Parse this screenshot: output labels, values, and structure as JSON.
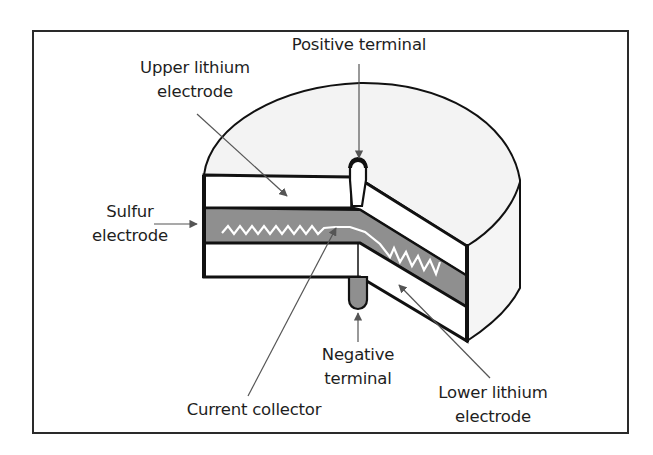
{
  "diagram": {
    "colors": {
      "frame": "#2a2a2a",
      "outline": "#111111",
      "casing_fill": "#f3f3f3",
      "electrode_fill": "#ffffff",
      "sulfur_fill": "#8f8f8f",
      "collector": "#ffffff",
      "leader": "#555555"
    },
    "labels": {
      "positive_terminal": {
        "line1": "Positive terminal"
      },
      "upper_lithium": {
        "line1": "Upper lithium",
        "line2": "electrode"
      },
      "sulfur": {
        "line1": "Sulfur",
        "line2": "electrode"
      },
      "negative_terminal": {
        "line1": "Negative",
        "line2": "terminal"
      },
      "current_collector": {
        "line1": "Current collector"
      },
      "lower_lithium": {
        "line1": "Lower lithium",
        "line2": "electrode"
      }
    }
  }
}
